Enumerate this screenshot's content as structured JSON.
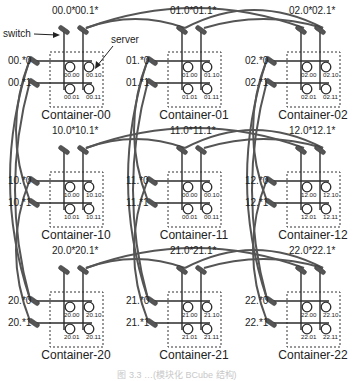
{
  "annotations": {
    "switch_label": "switch",
    "server_label": "server"
  },
  "caption": "图 3.3  …(模块化 BCube 结构)",
  "colors": {
    "line": "#2b2b2b",
    "arc": "#555555",
    "switch": "#555555",
    "dashed": "#333333",
    "text": "#222222"
  },
  "containers": [
    {
      "id": "00",
      "row": 0,
      "col": 0,
      "name": "Container-00",
      "top_switches": [
        "00.0*",
        "00.1*"
      ],
      "left_switches": [
        "00.*0",
        "00.*1"
      ],
      "servers": [
        "00.00",
        "00.10",
        "00.01",
        "00.11"
      ]
    },
    {
      "id": "01",
      "row": 0,
      "col": 1,
      "name": "Container-01",
      "top_switches": [
        "01.0*",
        "01.1*"
      ],
      "left_switches": [
        "01.*0",
        "01.*1"
      ],
      "servers": [
        "01.00",
        "01.10",
        "01.01",
        "01.11"
      ]
    },
    {
      "id": "02",
      "row": 0,
      "col": 2,
      "name": "Container-02",
      "top_switches": [
        "02.0*",
        "02.1*"
      ],
      "left_switches": [
        "02.*0",
        "02.*1"
      ],
      "servers": [
        "02.00",
        "02.10",
        "02.01",
        "02.11"
      ]
    },
    {
      "id": "10",
      "row": 1,
      "col": 0,
      "name": "Container-10",
      "top_switches": [
        "10.0*",
        "10.1*"
      ],
      "left_switches": [
        "10.*0",
        "10.*1"
      ],
      "servers": [
        "10.00",
        "10.10",
        "10.01",
        "10.11"
      ]
    },
    {
      "id": "11",
      "row": 1,
      "col": 1,
      "name": "Container-11",
      "top_switches": [
        "11.0*",
        "11.1*"
      ],
      "left_switches": [
        "11.*0",
        "11.*1"
      ],
      "servers": [
        "00.00",
        "00.10",
        "00.01",
        "00.11"
      ]
    },
    {
      "id": "12",
      "row": 1,
      "col": 2,
      "name": "Container-12",
      "top_switches": [
        "12.0*",
        "12.1*"
      ],
      "left_switches": [
        "12.*0",
        "12.*1"
      ],
      "servers": [
        "12.00",
        "12.10",
        "12.01",
        "12.11"
      ]
    },
    {
      "id": "20",
      "row": 2,
      "col": 0,
      "name": "Container-20",
      "top_switches": [
        "20.0*",
        "20.1*"
      ],
      "left_switches": [
        "20.*0",
        "20.*1"
      ],
      "servers": [
        "20.00",
        "20.10",
        "20.01",
        "20.11"
      ]
    },
    {
      "id": "21",
      "row": 2,
      "col": 1,
      "name": "Container-21",
      "top_switches": [
        "21.0*",
        "21.1*"
      ],
      "left_switches": [
        "21.*0",
        "21.*1"
      ],
      "servers": [
        "21.00",
        "21.10",
        "21.01",
        "21.11"
      ]
    },
    {
      "id": "22",
      "row": 2,
      "col": 2,
      "name": "Container-22",
      "top_switches": [
        "22.0*",
        "22.1*"
      ],
      "left_switches": [
        "22.*0",
        "22.*1"
      ],
      "servers": [
        "22.00",
        "22.10",
        "22.01",
        "22.11"
      ]
    }
  ]
}
